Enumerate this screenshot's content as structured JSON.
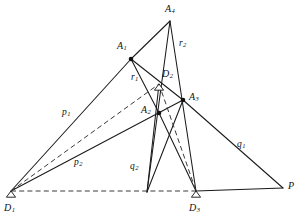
{
  "figure": {
    "stroke_color": "#1a1a1a",
    "background": "#ffffff",
    "dash_color": "#3a3a3a",
    "width": 301,
    "height": 223
  },
  "points": [
    {
      "id": "A4",
      "base": "A",
      "sub": "4",
      "x": 170,
      "y": 21,
      "label_x": 165,
      "label_y": 4,
      "marker": "vertex"
    },
    {
      "id": "A1",
      "base": "A",
      "sub": "1",
      "x": 131,
      "y": 59,
      "label_x": 117,
      "label_y": 41,
      "marker": "dot"
    },
    {
      "id": "D2",
      "base": "D",
      "sub": "2",
      "x": 159,
      "y": 84,
      "label_x": 162,
      "label_y": 69,
      "marker": "support"
    },
    {
      "id": "A3",
      "base": "A",
      "sub": "3",
      "x": 183,
      "y": 100,
      "label_x": 189,
      "label_y": 92,
      "marker": "dot"
    },
    {
      "id": "A2",
      "base": "A",
      "sub": "2",
      "x": 159,
      "y": 113,
      "label_x": 141,
      "label_y": 105,
      "marker": "dot"
    },
    {
      "id": "D1",
      "base": "D",
      "sub": "1",
      "x": 11,
      "y": 191,
      "label_x": 4,
      "label_y": 203,
      "marker": "support"
    },
    {
      "id": "D3",
      "base": "D",
      "sub": "3",
      "x": 196,
      "y": 191,
      "label_x": 189,
      "label_y": 203,
      "marker": "support"
    },
    {
      "id": "P",
      "base": "P",
      "sub": "",
      "x": 283,
      "y": 188,
      "label_x": 288,
      "label_y": 181,
      "marker": "vertex"
    }
  ],
  "segment_labels": [
    {
      "id": "p1",
      "base": "p",
      "sub": "1",
      "x": 62,
      "y": 108
    },
    {
      "id": "p2",
      "base": "p",
      "sub": "2",
      "x": 74,
      "y": 158
    },
    {
      "id": "r1",
      "base": "r",
      "sub": "1",
      "x": 131,
      "y": 73
    },
    {
      "id": "r2",
      "base": "r",
      "sub": "2",
      "x": 179,
      "y": 39
    },
    {
      "id": "q1",
      "base": "q",
      "sub": "1",
      "x": 237,
      "y": 140
    },
    {
      "id": "q2",
      "base": "q",
      "sub": "2",
      "x": 130,
      "y": 162
    }
  ],
  "edges": {
    "solid": [
      {
        "name": "D1-A1",
        "x1": 11,
        "y1": 191,
        "x2": 131,
        "y2": 59
      },
      {
        "name": "A1-A4",
        "x1": 131,
        "y1": 59,
        "x2": 170,
        "y2": 21
      },
      {
        "name": "A4-D3",
        "x1": 170,
        "y1": 21,
        "x2": 196,
        "y2": 191
      },
      {
        "name": "A4-bottom-left-pin",
        "x1": 170,
        "y1": 21,
        "x2": 147,
        "y2": 192
      },
      {
        "name": "A1-A2",
        "x1": 131,
        "y1": 59,
        "x2": 159,
        "y2": 113
      },
      {
        "name": "A1-A3",
        "x1": 131,
        "y1": 59,
        "x2": 183,
        "y2": 100
      },
      {
        "name": "D1-A3-p2",
        "x1": 11,
        "y1": 191,
        "x2": 183,
        "y2": 100
      },
      {
        "name": "A3-P-q1",
        "x1": 183,
        "y1": 100,
        "x2": 283,
        "y2": 188
      },
      {
        "name": "D3-P",
        "x1": 196,
        "y1": 191,
        "x2": 283,
        "y2": 188
      },
      {
        "name": "A2-D3",
        "x1": 159,
        "y1": 113,
        "x2": 196,
        "y2": 191
      },
      {
        "name": "A3-bottom-pin",
        "x1": 183,
        "y1": 100,
        "x2": 147,
        "y2": 192
      },
      {
        "name": "D2-A2-bottom",
        "x1": 159,
        "y1": 84,
        "x2": 147,
        "y2": 192
      }
    ],
    "dashed": [
      {
        "name": "D1-D2-dashed",
        "x1": 11,
        "y1": 191,
        "x2": 159,
        "y2": 84
      },
      {
        "name": "D2-D3-dashed",
        "x1": 159,
        "y1": 84,
        "x2": 196,
        "y2": 191
      },
      {
        "name": "D1-D3-baseline-dashed",
        "x1": 11,
        "y1": 191,
        "x2": 196,
        "y2": 191
      }
    ]
  }
}
